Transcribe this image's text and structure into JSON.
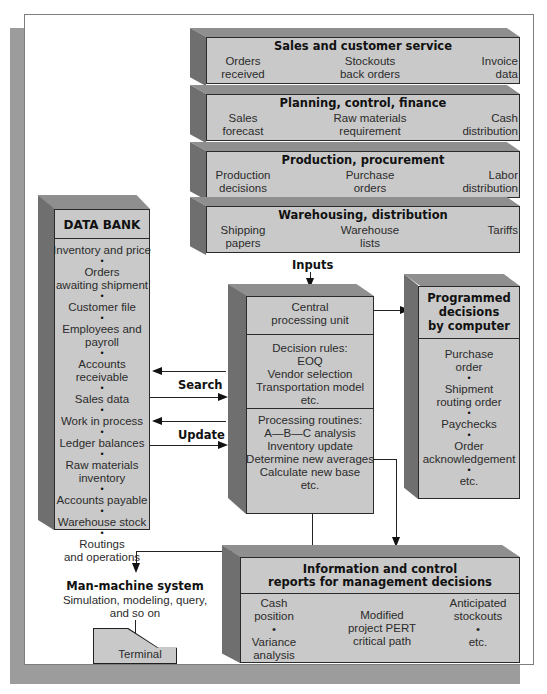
{
  "top_layers": [
    {
      "title": "Sales and customer service",
      "items": [
        [
          "Orders",
          "received"
        ],
        [
          "Stockouts",
          "back orders"
        ],
        [
          "Invoice",
          "data"
        ]
      ]
    },
    {
      "title": "Planning, control, finance",
      "items": [
        [
          "Sales",
          "forecast"
        ],
        [
          "Raw materials",
          "requirement"
        ],
        [
          "Cash",
          "distribution"
        ]
      ]
    },
    {
      "title": "Production, procurement",
      "items": [
        [
          "Production",
          "decisions"
        ],
        [
          "Purchase",
          "orders"
        ],
        [
          "Labor",
          "distribution"
        ]
      ]
    },
    {
      "title": "Warehousing, distribution",
      "items": [
        [
          "Shipping",
          "papers"
        ],
        [
          "Warehouse",
          "lists"
        ],
        [
          "Tariffs",
          ""
        ]
      ]
    }
  ],
  "data_bank": {
    "title": "DATA BANK",
    "items": [
      "Inventory and price",
      "Orders\nawaiting shipment",
      "Customer file",
      "Employees and payroll",
      "Accounts receivable",
      "Sales data",
      "Work in process",
      "Ledger balances",
      "Raw materials\ninventory",
      "Accounts payable",
      "Warehouse stock",
      "Routings\nand operations"
    ]
  },
  "labels": {
    "inputs": "Inputs",
    "search": "Search",
    "update": "Update"
  },
  "cpu": {
    "title_lines": [
      "Central",
      "processing unit"
    ],
    "decision_rules": [
      "Decision rules:",
      "EOQ",
      "Vendor selection",
      "Transportation model",
      "etc."
    ],
    "processing_routines": [
      "Processing routines:",
      "A—B—C analysis",
      "Inventory update",
      "Determine new averages",
      "Calculate new base",
      "etc."
    ]
  },
  "programmed": {
    "title_lines": [
      "Programmed",
      "decisions",
      "by computer"
    ],
    "items": [
      "Purchase\norder",
      "Shipment\nrouting order",
      "Paychecks",
      "Order\nacknowledgement",
      "etc."
    ]
  },
  "man_machine": {
    "title": "Man-machine system",
    "lines": [
      "Simulation, modeling, query,",
      "and so on"
    ],
    "terminal": "Terminal"
  },
  "reports": {
    "title_lines": [
      "Information and control",
      "reports for management decisions"
    ],
    "col1": [
      "Cash",
      "position",
      "•",
      "Variance",
      "analysis"
    ],
    "col2": [
      "Modified",
      "project PERT",
      "critical path"
    ],
    "col3": [
      "Anticipated",
      "stockouts",
      "•",
      "etc."
    ]
  },
  "colors": {
    "face": "#c9c9c9",
    "top": "#8f8f8f",
    "side": "#6f6f6f",
    "frame_shadow": "#9c9c9c"
  }
}
